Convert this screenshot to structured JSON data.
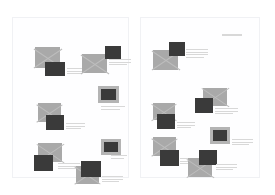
{
  "canvas": {
    "width": 275,
    "height": 195,
    "background": "#ffffff",
    "title": "two-page document layout preview"
  },
  "palette": {
    "page_background": "#fefeff",
    "page_border": "#f0f1f4",
    "placeholder_fill": "#a9a9a9",
    "placeholder_cross": "#bdbdbd",
    "thumbnail_fill": "#3a3a3a",
    "thumbnail_frame": "#b4b4b4",
    "text_line": "#d8d8d8"
  },
  "pages": [
    {
      "name": "left-page",
      "label": "Page 1",
      "x": 12,
      "y": 17,
      "width": 117,
      "height": 161,
      "elements": [
        {
          "kind": "placeholder",
          "name": "image-placeholder",
          "x": 22,
          "y": 29,
          "w": 25,
          "h": 21
        },
        {
          "kind": "thumbnail",
          "name": "thumbnail-block",
          "x": 32,
          "y": 44,
          "w": 20,
          "h": 14,
          "framed": false
        },
        {
          "kind": "lines",
          "name": "text-lines",
          "x": 54,
          "y": 50,
          "w": 19,
          "count": 3
        },
        {
          "kind": "placeholder",
          "name": "image-placeholder",
          "x": 69,
          "y": 36,
          "w": 25,
          "h": 19
        },
        {
          "kind": "thumbnail",
          "name": "thumbnail-block",
          "x": 92,
          "y": 28,
          "w": 16,
          "h": 13,
          "framed": false
        },
        {
          "kind": "lines",
          "name": "text-lines",
          "x": 96,
          "y": 41,
          "w": 22,
          "count": 3
        },
        {
          "kind": "thumbnail",
          "name": "thumbnail-block",
          "x": 85,
          "y": 68,
          "w": 21,
          "h": 17,
          "framed": true
        },
        {
          "kind": "lines",
          "name": "text-lines",
          "x": 88,
          "y": 88,
          "w": 24,
          "count": 2
        },
        {
          "kind": "placeholder",
          "name": "image-placeholder",
          "x": 25,
          "y": 85,
          "w": 23,
          "h": 19
        },
        {
          "kind": "thumbnail",
          "name": "thumbnail-block",
          "x": 33,
          "y": 97,
          "w": 18,
          "h": 15,
          "framed": false
        },
        {
          "kind": "lines",
          "name": "text-lines",
          "x": 53,
          "y": 105,
          "w": 19,
          "count": 3
        },
        {
          "kind": "placeholder",
          "name": "image-placeholder",
          "x": 25,
          "y": 125,
          "w": 24,
          "h": 19
        },
        {
          "kind": "thumbnail",
          "name": "thumbnail-block",
          "x": 21,
          "y": 137,
          "w": 19,
          "h": 16,
          "framed": false
        },
        {
          "kind": "lines",
          "name": "text-lines",
          "x": 45,
          "y": 145,
          "w": 22,
          "count": 3
        },
        {
          "kind": "thumbnail",
          "name": "thumbnail-block",
          "x": 88,
          "y": 121,
          "w": 20,
          "h": 16,
          "framed": true
        },
        {
          "kind": "lines",
          "name": "text-lines",
          "x": 98,
          "y": 137,
          "w": 16,
          "count": 2
        },
        {
          "kind": "placeholder",
          "name": "image-placeholder",
          "x": 63,
          "y": 148,
          "w": 23,
          "h": 18
        },
        {
          "kind": "thumbnail",
          "name": "thumbnail-block",
          "x": 68,
          "y": 143,
          "w": 20,
          "h": 16,
          "framed": false
        },
        {
          "kind": "lines",
          "name": "text-lines",
          "x": 89,
          "y": 158,
          "w": 21,
          "count": 3
        }
      ]
    },
    {
      "name": "right-page",
      "label": "Page 2",
      "x": 140,
      "y": 17,
      "width": 120,
      "height": 161,
      "elements": [
        {
          "kind": "bar",
          "name": "header-rule",
          "x": 81,
          "y": 16,
          "w": 20
        },
        {
          "kind": "placeholder",
          "name": "image-placeholder",
          "x": 12,
          "y": 32,
          "w": 25,
          "h": 20
        },
        {
          "kind": "thumbnail",
          "name": "thumbnail-block",
          "x": 28,
          "y": 24,
          "w": 16,
          "h": 14,
          "framed": false
        },
        {
          "kind": "lines",
          "name": "text-lines",
          "x": 45,
          "y": 31,
          "w": 22,
          "count": 4
        },
        {
          "kind": "placeholder",
          "name": "image-placeholder",
          "x": 62,
          "y": 70,
          "w": 24,
          "h": 18
        },
        {
          "kind": "thumbnail",
          "name": "thumbnail-block",
          "x": 54,
          "y": 80,
          "w": 18,
          "h": 15,
          "framed": false
        },
        {
          "kind": "lines",
          "name": "text-lines",
          "x": 74,
          "y": 90,
          "w": 23,
          "count": 3
        },
        {
          "kind": "placeholder",
          "name": "image-placeholder",
          "x": 12,
          "y": 85,
          "w": 22,
          "h": 17
        },
        {
          "kind": "thumbnail",
          "name": "thumbnail-block",
          "x": 16,
          "y": 96,
          "w": 18,
          "h": 15,
          "framed": false
        },
        {
          "kind": "lines",
          "name": "text-lines",
          "x": 36,
          "y": 104,
          "w": 18,
          "count": 3
        },
        {
          "kind": "thumbnail",
          "name": "thumbnail-block",
          "x": 69,
          "y": 109,
          "w": 20,
          "h": 17,
          "framed": true
        },
        {
          "kind": "lines",
          "name": "text-lines",
          "x": 91,
          "y": 121,
          "w": 21,
          "count": 3
        },
        {
          "kind": "placeholder",
          "name": "image-placeholder",
          "x": 12,
          "y": 119,
          "w": 23,
          "h": 19
        },
        {
          "kind": "thumbnail",
          "name": "thumbnail-block",
          "x": 19,
          "y": 132,
          "w": 19,
          "h": 16,
          "framed": false
        },
        {
          "kind": "lines",
          "name": "text-lines",
          "x": 39,
          "y": 140,
          "w": 20,
          "count": 3
        },
        {
          "kind": "placeholder",
          "name": "image-placeholder",
          "x": 47,
          "y": 140,
          "w": 24,
          "h": 19
        },
        {
          "kind": "thumbnail",
          "name": "thumbnail-block",
          "x": 58,
          "y": 132,
          "w": 18,
          "h": 15,
          "framed": false
        },
        {
          "kind": "lines",
          "name": "text-lines",
          "x": 75,
          "y": 146,
          "w": 21,
          "count": 3
        }
      ]
    }
  ]
}
